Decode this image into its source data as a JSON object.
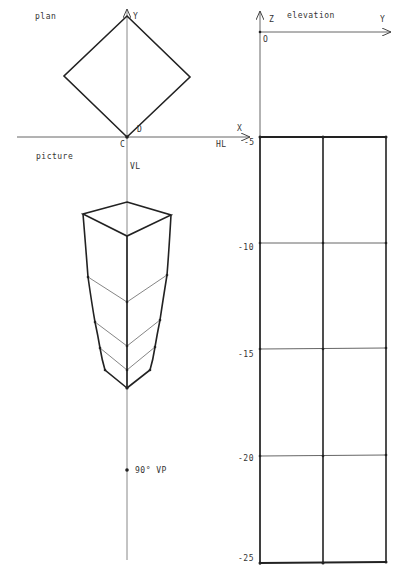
{
  "labels": {
    "plan": "plan",
    "picture": "picture",
    "elevation": "elevation",
    "plan_y": "Y",
    "plan_x": "X",
    "point_c": "C",
    "point_d": "D",
    "hl": "HL",
    "vl": "VL",
    "vp": "90° VP",
    "elev_z": "Z",
    "elev_y": "Y",
    "elev_o": "O"
  },
  "elevation_ticks": [
    "-5",
    "-10",
    "-15",
    "-20",
    "-25"
  ],
  "colors": {
    "ink": "#222222",
    "axis": "#666666",
    "thin": "#777777"
  }
}
